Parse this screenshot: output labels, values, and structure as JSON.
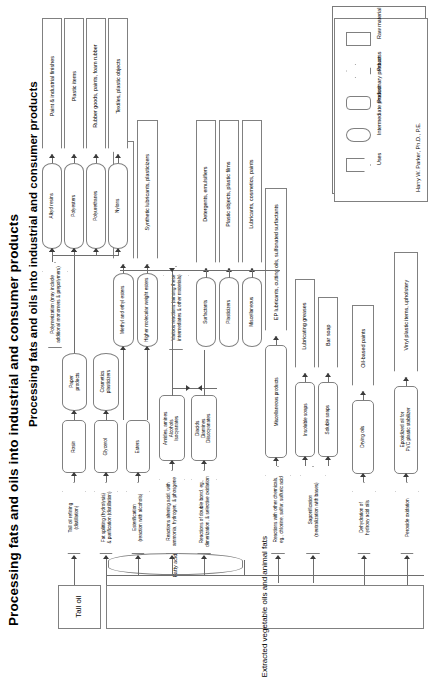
{
  "title": "Processing fats and oils into industrial and consumer products",
  "author": "Harry W. Parker, Ph.D., P.E.",
  "legend": {
    "items": [
      {
        "label": "Raw material",
        "shape": "rectangle"
      },
      {
        "label": "Process",
        "shape": "arrow"
      },
      {
        "label": "Preliminary product",
        "shape": "rounded-rectangle"
      },
      {
        "label": "Intermediate product",
        "shape": "lozenge"
      },
      {
        "label": "Uses",
        "shape": "chevron"
      }
    ]
  },
  "raw_materials": [
    {
      "id": "tall-oil",
      "label": "Tall oil"
    },
    {
      "id": "extracted-oils",
      "label": "Extracted vegetable oils and animal fats"
    }
  ],
  "intermediates_base": [
    {
      "id": "fatty-acids",
      "label": "Fatty acids"
    }
  ],
  "processes": [
    {
      "id": "tall-oil-refining",
      "label": "Tall oil refining\n(distillation)"
    },
    {
      "id": "fat-splitting",
      "label": "Fat splitting (hydrolysis)\n& purification (distillation)"
    },
    {
      "id": "esterification",
      "label": "Esterification\n(reaction with alcohols)"
    },
    {
      "id": "reactions-altering-acid",
      "label": "Reactions altering acid, with\nammonia, hydrogen, & phosgene"
    },
    {
      "id": "reactions-double-bond",
      "label": "Reactions of double bond, eg.,\ndimerization, & selective oxidation"
    },
    {
      "id": "reactions-other-chemicals",
      "label": "Reactions with other chemicals,\neg., chlorine, sulfur, sulfuric acid"
    },
    {
      "id": "saponification",
      "label": "Saponification\n(neutralization with bases)"
    },
    {
      "id": "dehydration",
      "label": "Dehydration of\nhydroxy acid oils"
    },
    {
      "id": "peroxide-oxidation",
      "label": "Peroxide oxidation"
    },
    {
      "id": "polymerization",
      "label": "Polymerization (may include\nadditional monomers & prepolymers)"
    },
    {
      "id": "various-reactions",
      "label": "Various reactions (among these\nintermediates & other materials)"
    }
  ],
  "preliminary_products": [
    {
      "id": "rosin",
      "label": "Rosin"
    },
    {
      "id": "glycerol",
      "label": "Glycerol"
    },
    {
      "id": "esters",
      "label": "Esters"
    },
    {
      "id": "amides-amines",
      "label": "Amides, amines\nAlcohols\nIsocyanates"
    },
    {
      "id": "diacids",
      "label": "Diacids\nDiamines\nDiisocyanates"
    },
    {
      "id": "misc-products",
      "label": "Miscellaneous products"
    },
    {
      "id": "insoluble-soaps",
      "label": "Insoluble soaps"
    },
    {
      "id": "soluble-soaps",
      "label": "Soluble soaps"
    },
    {
      "id": "drying-oils",
      "label": "Drying oils"
    },
    {
      "id": "epoxidized-oil",
      "label": "Epoxidized oil for\nPVC plastic stabilizer"
    }
  ],
  "intermediate_products": [
    {
      "id": "paper-products",
      "label": "Paper\nproducts"
    },
    {
      "id": "cosmetics-plasticizers",
      "label": "Cosmetics\nplasticizers"
    },
    {
      "id": "methyl-ethyl-esters",
      "label": "Methyl and ethyl esters"
    },
    {
      "id": "higher-mw-esters",
      "label": "Higher molecular weight esters"
    },
    {
      "id": "surfactants",
      "label": "Surfactants"
    },
    {
      "id": "plasticizers",
      "label": "Plasticizers"
    },
    {
      "id": "miscellaneous",
      "label": "Miscellaneous"
    },
    {
      "id": "alkyd-resins",
      "label": "Alkyd resins"
    },
    {
      "id": "polyesters",
      "label": "Polyesters"
    },
    {
      "id": "polyurethanes",
      "label": "Polyurethanes"
    },
    {
      "id": "nylons",
      "label": "Nylons"
    }
  ],
  "uses": [
    {
      "id": "paint-industrial-finishes",
      "label": "Paint & industrial finishes"
    },
    {
      "id": "plastic-items",
      "label": "Plastic items"
    },
    {
      "id": "rubber-goods",
      "label": "Rubber goods, paints, foam rubber"
    },
    {
      "id": "textiles-plastic-objects",
      "label": "Textiles, plastic objects"
    },
    {
      "id": "biodiesel-fuel",
      "label": "Biodiesel fuel"
    },
    {
      "id": "synthetic-lubricants",
      "label": "Synthetic lubricants, plasticizers"
    },
    {
      "id": "detergents-emulsifiers",
      "label": "Detergents, emulsifiers"
    },
    {
      "id": "plastic-objects-films",
      "label": "Plastic objects, plastic films"
    },
    {
      "id": "lubricants-cosmetics-paints",
      "label": "Lubricants, cosmetics, paints"
    },
    {
      "id": "ep-lubricants",
      "label": "EP lubricants, cutting oils, sulfonated surfactants"
    },
    {
      "id": "lubricating-greases",
      "label": "Lubricating greases"
    },
    {
      "id": "bar-soap",
      "label": "Bar soap"
    },
    {
      "id": "oil-based-paints",
      "label": "Oil-based paints"
    },
    {
      "id": "vinyl-plastic-items",
      "label": "Vinyl plastic items, upholstery"
    }
  ]
}
